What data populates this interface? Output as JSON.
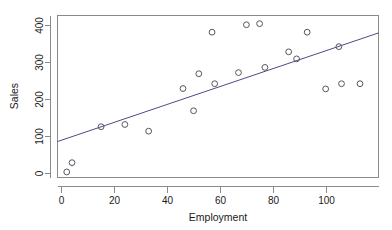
{
  "chart_data": {
    "type": "scatter",
    "title": "",
    "xlabel": "Employment",
    "ylabel": "Sales",
    "xlim": [
      -1.5,
      120
    ],
    "ylim": [
      -12,
      425
    ],
    "xticks": [
      0,
      20,
      40,
      60,
      80,
      100
    ],
    "xtick_labels": [
      "0",
      "20",
      "40",
      "60",
      "80",
      "100"
    ],
    "yticks": [
      0,
      100,
      200,
      300,
      400
    ],
    "ytick_labels": [
      "0",
      "100",
      "200",
      "300",
      "400"
    ],
    "grid": false,
    "legend": null,
    "marker": "open-circle",
    "marker_color": "#55555f",
    "points": [
      {
        "x": 2,
        "y": 3
      },
      {
        "x": 4,
        "y": 28
      },
      {
        "x": 15,
        "y": 125
      },
      {
        "x": 24,
        "y": 131
      },
      {
        "x": 33,
        "y": 113
      },
      {
        "x": 46,
        "y": 228
      },
      {
        "x": 50,
        "y": 168
      },
      {
        "x": 52,
        "y": 268
      },
      {
        "x": 57,
        "y": 380
      },
      {
        "x": 58,
        "y": 241
      },
      {
        "x": 67,
        "y": 271
      },
      {
        "x": 70,
        "y": 400
      },
      {
        "x": 75,
        "y": 403
      },
      {
        "x": 77,
        "y": 285
      },
      {
        "x": 86,
        "y": 327
      },
      {
        "x": 89,
        "y": 308
      },
      {
        "x": 93,
        "y": 380
      },
      {
        "x": 100,
        "y": 227
      },
      {
        "x": 105,
        "y": 341
      },
      {
        "x": 106,
        "y": 241
      },
      {
        "x": 113,
        "y": 241
      }
    ],
    "series": [
      {
        "name": "Regression line",
        "type": "line",
        "color": "#4b4b88",
        "x": [
          -1.5,
          120
        ],
        "y": [
          85,
          378
        ]
      }
    ]
  }
}
